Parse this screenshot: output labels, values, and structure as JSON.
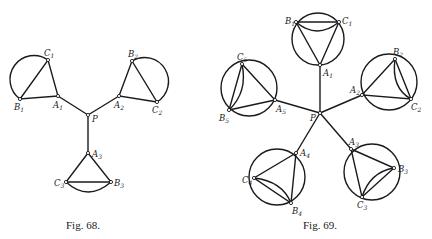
{
  "figures": [
    {
      "id": "fig68",
      "caption": "Fig. 68.",
      "center_label": "P",
      "triangles": [
        {
          "labels": [
            "A",
            "B",
            "C"
          ],
          "index": "1",
          "circumscribed_circle": false,
          "inner_arc": true
        },
        {
          "labels": [
            "A",
            "B",
            "C"
          ],
          "index": "2",
          "circumscribed_circle": false,
          "inner_arc": true
        },
        {
          "labels": [
            "A",
            "B",
            "C"
          ],
          "index": "3",
          "circumscribed_circle": false,
          "inner_arc": true
        }
      ]
    },
    {
      "id": "fig69",
      "caption": "Fig. 69.",
      "center_label": "P",
      "triangles": [
        {
          "labels": [
            "A",
            "B",
            "C"
          ],
          "index": "1",
          "circumscribed_circle": true,
          "inner_arc": true
        },
        {
          "labels": [
            "A",
            "B",
            "C"
          ],
          "index": "2",
          "circumscribed_circle": true,
          "inner_arc": true
        },
        {
          "labels": [
            "A",
            "B",
            "C"
          ],
          "index": "3",
          "circumscribed_circle": true,
          "inner_arc": true
        },
        {
          "labels": [
            "A",
            "B",
            "C"
          ],
          "index": "4",
          "circumscribed_circle": true,
          "inner_arc": true
        },
        {
          "labels": [
            "A",
            "B",
            "C"
          ],
          "index": "5",
          "circumscribed_circle": true,
          "inner_arc": true
        }
      ]
    }
  ],
  "labels": {
    "fig68": {
      "P": "P",
      "A1": "A",
      "B1": "B",
      "C1": "C",
      "s1": "1",
      "A2": "A",
      "B2": "B",
      "C2": "C",
      "s2": "2",
      "A3": "A",
      "B3": "B",
      "C3": "C",
      "s3": "3"
    },
    "fig69": {
      "P": "P",
      "A1": "A",
      "B1": "B",
      "C1": "C",
      "s1": "1",
      "A2": "A",
      "B2": "B",
      "C2": "C",
      "s2": "2",
      "A3": "A",
      "B3": "B",
      "C3": "C",
      "s3": "3",
      "A4": "A",
      "B4": "B",
      "C4": "C",
      "s4": "4",
      "A5": "A",
      "B5": "B",
      "C5": "C",
      "s5": "5"
    }
  }
}
